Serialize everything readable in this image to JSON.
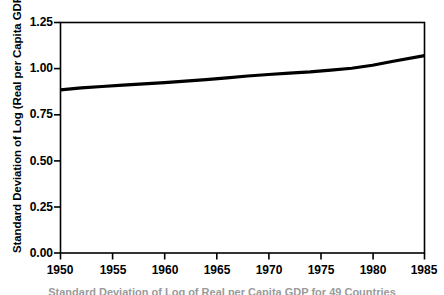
{
  "chart_data": {
    "type": "line",
    "title": "",
    "subtitle": "",
    "xlabel": "",
    "ylabel": "Standard Deviation of Log (Real per Capita GDP)",
    "xlim": [
      1950,
      1985
    ],
    "ylim": [
      0.0,
      1.25
    ],
    "grid": false,
    "legend": null,
    "legend_position": "none",
    "x_ticks": [
      1950,
      1955,
      1960,
      1965,
      1970,
      1975,
      1980,
      1985
    ],
    "x_tick_labels": [
      "1950",
      "1955",
      "1960",
      "1965",
      "1970",
      "1975",
      "1980",
      "1985"
    ],
    "y_ticks": [
      0.0,
      0.25,
      0.5,
      0.75,
      1.0,
      1.25
    ],
    "y_tick_labels": [
      "0.00",
      "0.25",
      "0.50",
      "0.75",
      "1.00",
      "1.25"
    ],
    "line_color": "#000000",
    "line_width": 3,
    "axis_color": "#000000",
    "background_color": "#ffffff",
    "series": [
      {
        "name": "Standard Deviation of Log (Real per Capita GDP)",
        "x": [
          1950,
          1952,
          1954,
          1956,
          1958,
          1960,
          1962,
          1964,
          1966,
          1968,
          1970,
          1972,
          1974,
          1976,
          1978,
          1980,
          1982,
          1985
        ],
        "values": [
          0.885,
          0.895,
          0.903,
          0.91,
          0.917,
          0.924,
          0.932,
          0.94,
          0.95,
          0.96,
          0.968,
          0.975,
          0.982,
          0.992,
          1.002,
          1.018,
          1.04,
          1.07
        ]
      }
    ]
  },
  "caption": {
    "text": "Standard Deviation of Log of Real per Capita GDP for 49 Countries"
  }
}
